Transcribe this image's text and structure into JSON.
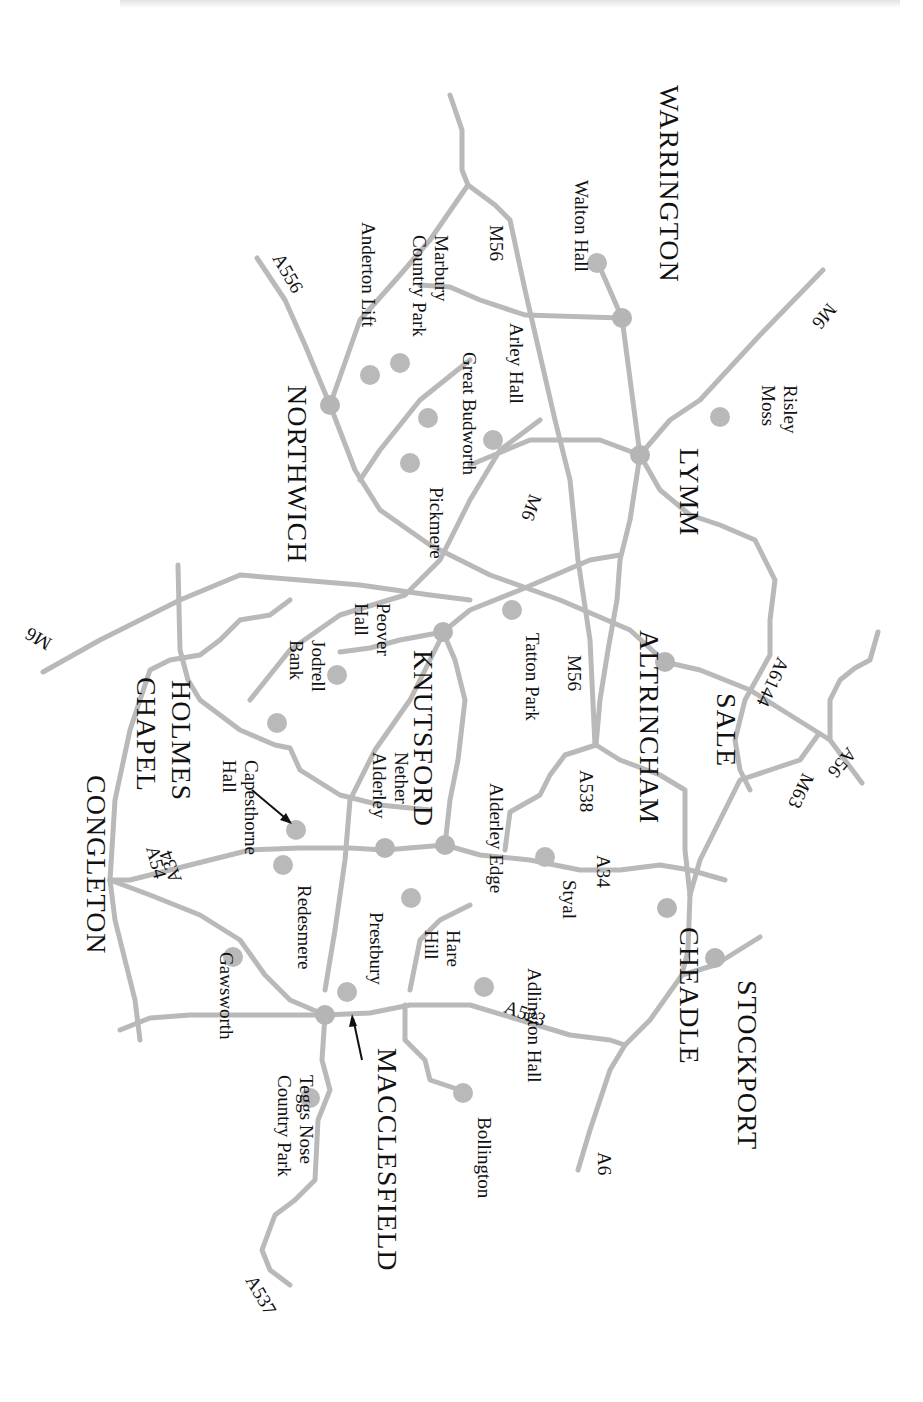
{
  "map": {
    "orientation": "rotated 90deg clockwise",
    "colors": {
      "road": "#b9b9b9",
      "node": "#b5b5b5",
      "text": "#111111",
      "background": "#ffffff"
    },
    "towns": [
      {
        "id": "warrington",
        "label": "WARRINGTON",
        "x": 660,
        "y": 85
      },
      {
        "id": "lymm",
        "label": "LYMM",
        "x": 680,
        "y": 448
      },
      {
        "id": "northwich",
        "label": "NORTHWICH",
        "x": 288,
        "y": 385
      },
      {
        "id": "knutsford",
        "label": "KNUTSFORD",
        "x": 414,
        "y": 650
      },
      {
        "id": "altrincham",
        "label": "ALTRINCHAM",
        "x": 640,
        "y": 630
      },
      {
        "id": "sale",
        "label": "SALE",
        "x": 717,
        "y": 693
      },
      {
        "id": "holmes",
        "label": "HOLMES",
        "x": 172,
        "y": 680
      },
      {
        "id": "chapel",
        "label": "CHAPEL",
        "x": 137,
        "y": 677
      },
      {
        "id": "congleton",
        "label": "CONGLETON",
        "x": 87,
        "y": 775
      },
      {
        "id": "cheadle",
        "label": "CHEADLE",
        "x": 680,
        "y": 927
      },
      {
        "id": "stockport",
        "label": "STOCKPORT",
        "x": 738,
        "y": 980
      },
      {
        "id": "macclesfield",
        "label": "MACCLESFIELD",
        "x": 378,
        "y": 1048
      }
    ],
    "places": [
      {
        "id": "walton-hall",
        "lines": [
          "Walton Hall"
        ],
        "x": 575,
        "y": 180
      },
      {
        "id": "risley-moss",
        "lines": [
          "Risley",
          "Moss"
        ],
        "x": 784,
        "y": 385
      },
      {
        "id": "marbury",
        "lines": [
          "Marbury",
          "Country Park"
        ],
        "x": 435,
        "y": 235
      },
      {
        "id": "anderton-lift",
        "lines": [
          "Anderton Lift"
        ],
        "x": 362,
        "y": 222
      },
      {
        "id": "arley-hall",
        "lines": [
          "Arley Hall"
        ],
        "x": 510,
        "y": 323
      },
      {
        "id": "great-budworth",
        "lines": [
          "Great Budworth"
        ],
        "x": 463,
        "y": 352
      },
      {
        "id": "pickmere",
        "lines": [
          "Pickmere"
        ],
        "x": 430,
        "y": 487
      },
      {
        "id": "peover-hall",
        "lines": [
          "Peover",
          "Hall"
        ],
        "x": 377,
        "y": 603
      },
      {
        "id": "jodrell-bank",
        "lines": [
          "Jodrell",
          "Bank"
        ],
        "x": 312,
        "y": 640
      },
      {
        "id": "tatton-park",
        "lines": [
          "Tatton Park"
        ],
        "x": 526,
        "y": 633
      },
      {
        "id": "nether-alderley",
        "lines": [
          "Nether",
          "Alderley"
        ],
        "x": 395,
        "y": 752
      },
      {
        "id": "capesthorne-hall",
        "lines": [
          "Capesthorne",
          "Hall"
        ],
        "x": 245,
        "y": 760
      },
      {
        "id": "alderley-edge",
        "lines": [
          "Alderley Edge"
        ],
        "x": 490,
        "y": 783
      },
      {
        "id": "styal",
        "lines": [
          "Styal"
        ],
        "x": 563,
        "y": 880
      },
      {
        "id": "redesmere",
        "lines": [
          "Redesmere"
        ],
        "x": 298,
        "y": 885
      },
      {
        "id": "hare-hill",
        "lines": [
          "Hare",
          "Hill"
        ],
        "x": 447,
        "y": 930
      },
      {
        "id": "prestbury",
        "lines": [
          "Prestbury"
        ],
        "x": 370,
        "y": 912
      },
      {
        "id": "gawsworth",
        "lines": [
          "Gawsworth"
        ],
        "x": 220,
        "y": 952
      },
      {
        "id": "adlington-hall",
        "lines": [
          "Adlington Hall"
        ],
        "x": 528,
        "y": 968
      },
      {
        "id": "teggs-nose",
        "lines": [
          "Teggs Nose",
          "Country Park"
        ],
        "x": 300,
        "y": 1075
      },
      {
        "id": "bollington",
        "lines": [
          "Bollington"
        ],
        "x": 478,
        "y": 1117
      }
    ],
    "road_labels": [
      {
        "id": "m6-ne",
        "label": "M6",
        "x": 828,
        "y": 302,
        "rot": 130
      },
      {
        "id": "m56-n",
        "label": "M56",
        "x": 490,
        "y": 225,
        "rot": 90
      },
      {
        "id": "a556",
        "label": "A556",
        "x": 272,
        "y": 258,
        "rot": 60
      },
      {
        "id": "m6-mid",
        "label": "M6",
        "x": 530,
        "y": 493,
        "rot": 110
      },
      {
        "id": "m6-w",
        "label": "M6",
        "x": 53,
        "y": 640,
        "rot": 210
      },
      {
        "id": "a6144",
        "label": "A6144",
        "x": 778,
        "y": 656,
        "rot": 115
      },
      {
        "id": "m56-s",
        "label": "M56",
        "x": 568,
        "y": 655,
        "rot": 90
      },
      {
        "id": "a56",
        "label": "A56",
        "x": 848,
        "y": 746,
        "rot": 130
      },
      {
        "id": "m63",
        "label": "M63",
        "x": 803,
        "y": 772,
        "rot": 115
      },
      {
        "id": "a538",
        "label": "A538",
        "x": 580,
        "y": 770,
        "rot": 90
      },
      {
        "id": "a34-n",
        "label": "A34",
        "x": 597,
        "y": 855,
        "rot": 90
      },
      {
        "id": "a54",
        "label": "A54",
        "x": 146,
        "y": 848,
        "rot": 75
      },
      {
        "id": "a34-s",
        "label": "A34",
        "x": 182,
        "y": 880,
        "rot": 250
      },
      {
        "id": "a523",
        "label": "A523",
        "x": 503,
        "y": 1012,
        "rot": 20
      },
      {
        "id": "a6",
        "label": "A6",
        "x": 598,
        "y": 1152,
        "rot": 90
      },
      {
        "id": "a537",
        "label": "A537",
        "x": 245,
        "y": 1280,
        "rot": 60
      }
    ]
  }
}
